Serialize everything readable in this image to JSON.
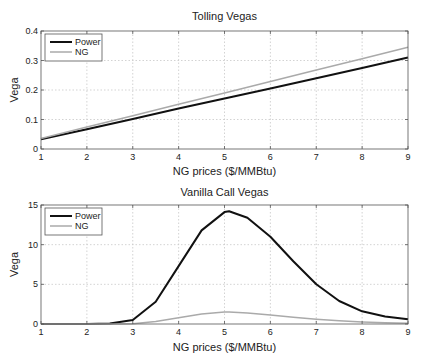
{
  "chart_data": [
    {
      "type": "line",
      "title": "Tolling Vegas",
      "xlabel": "NG prices ($/MMBtu)",
      "ylabel": "Vega",
      "xlim": [
        1,
        9
      ],
      "ylim": [
        0,
        0.4
      ],
      "xticks": [
        "1",
        "2",
        "3",
        "4",
        "5",
        "6",
        "7",
        "8",
        "9"
      ],
      "yticks": [
        "0",
        "0.1",
        "0.2",
        "0.3",
        "0.4"
      ],
      "grid": true,
      "legend_position": "upper-left",
      "x": [
        1,
        2,
        3,
        4,
        5,
        6,
        7,
        8,
        9
      ],
      "series": [
        {
          "name": "Power",
          "color": "#111111",
          "values": [
            0.033,
            0.067,
            0.102,
            0.137,
            0.171,
            0.205,
            0.24,
            0.275,
            0.31
          ]
        },
        {
          "name": "NG",
          "color": "#aaaaaa",
          "values": [
            0.036,
            0.075,
            0.113,
            0.152,
            0.19,
            0.229,
            0.268,
            0.306,
            0.345
          ]
        }
      ]
    },
    {
      "type": "line",
      "title": "Vanilla Call Vegas",
      "xlabel": "NG prices ($/MMBtu)",
      "ylabel": "Vega",
      "xlim": [
        1,
        9
      ],
      "ylim": [
        0,
        15
      ],
      "xticks": [
        "1",
        "2",
        "3",
        "4",
        "5",
        "6",
        "7",
        "8",
        "9"
      ],
      "yticks": [
        "0",
        "5",
        "10",
        "15"
      ],
      "grid": true,
      "legend_position": "upper-left",
      "x": [
        1,
        1.5,
        2,
        2.5,
        3,
        3.5,
        4,
        4.5,
        5,
        5.1,
        5.5,
        6,
        6.5,
        7,
        7.5,
        8,
        8.5,
        9
      ],
      "series": [
        {
          "name": "Power",
          "color": "#111111",
          "values": [
            0,
            0,
            0,
            0.05,
            0.5,
            2.8,
            7.3,
            11.8,
            14.1,
            14.2,
            13.4,
            11.0,
            7.9,
            5.0,
            2.9,
            1.6,
            0.95,
            0.6
          ]
        },
        {
          "name": "NG",
          "color": "#aaaaaa",
          "values": [
            0,
            0,
            0,
            0,
            0.03,
            0.3,
            0.8,
            1.25,
            1.5,
            1.5,
            1.4,
            1.12,
            0.85,
            0.6,
            0.4,
            0.25,
            0.15,
            0.1
          ]
        }
      ]
    }
  ]
}
